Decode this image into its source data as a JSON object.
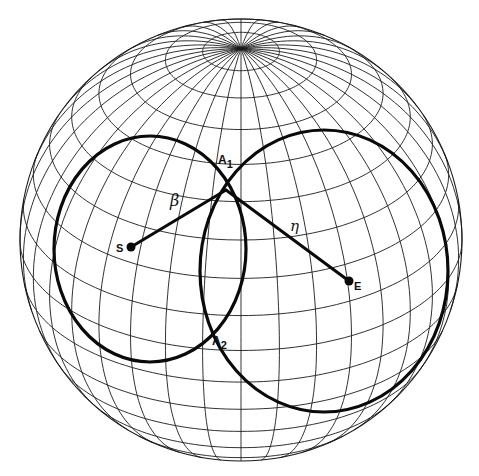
{
  "figure": {
    "sphere": {
      "cx": 241,
      "cy": 240,
      "r": 221,
      "tilt_deg": 60,
      "lat_step_deg": 10,
      "lon_step_deg": 10
    },
    "colors": {
      "ink": "#0a0a0a",
      "grid": "#1a1a1a",
      "background": "#ffffff"
    },
    "circles": [
      {
        "id": "left-circle",
        "cx": 150,
        "cy": 249,
        "rx": 96,
        "ry": 113,
        "rot": 0
      },
      {
        "id": "right-circle",
        "cx": 324,
        "cy": 271,
        "rx": 124,
        "ry": 141,
        "rot": 0
      }
    ],
    "points": {
      "S": {
        "x": 131,
        "y": 247,
        "label": "S"
      },
      "E": {
        "x": 349,
        "y": 281,
        "label": "E"
      },
      "A1": {
        "x": 226,
        "y": 190,
        "label": "A",
        "sub": "1"
      },
      "A2": {
        "x": 207,
        "y": 343,
        "label": "A",
        "sub": "2"
      }
    },
    "arcs": {
      "beta": {
        "label": "β",
        "from": "S",
        "to": "A1",
        "lx": 170,
        "ly": 206
      },
      "eta": {
        "label": "η",
        "from": "A1",
        "to": "E",
        "lx": 290,
        "ly": 231
      }
    }
  }
}
